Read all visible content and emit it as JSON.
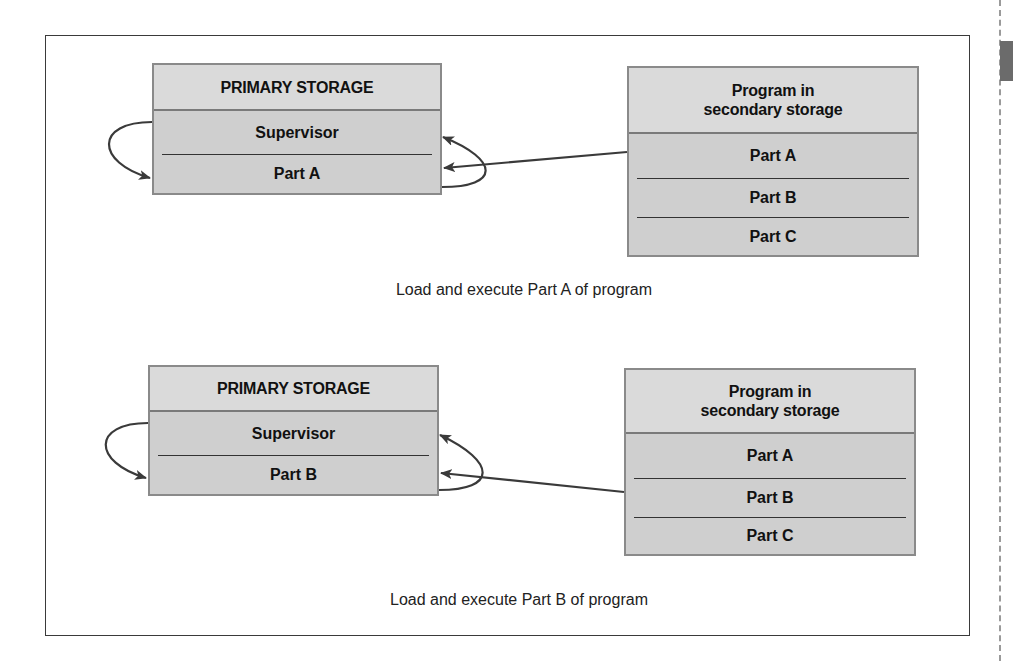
{
  "diagrams": [
    {
      "primary": {
        "title": "PRIMARY STORAGE",
        "rows": [
          "Supervisor",
          "Part A"
        ]
      },
      "secondary": {
        "title_line1": "Program in",
        "title_line2": "secondary storage",
        "rows": [
          "Part A",
          "Part B",
          "Part C"
        ]
      },
      "caption": "Load and execute Part A of program"
    },
    {
      "primary": {
        "title": "PRIMARY STORAGE",
        "rows": [
          "Supervisor",
          "Part B"
        ]
      },
      "secondary": {
        "title_line1": "Program in",
        "title_line2": "secondary storage",
        "rows": [
          "Part A",
          "Part B",
          "Part C"
        ]
      },
      "caption": "Load and execute Part B of program"
    }
  ],
  "colors": {
    "box_header": "#dadada",
    "box_body": "#cfcfcf",
    "box_border": "#8a8a8a",
    "arrow": "#3a3a3a",
    "side_tab": "#6b6b6b"
  }
}
